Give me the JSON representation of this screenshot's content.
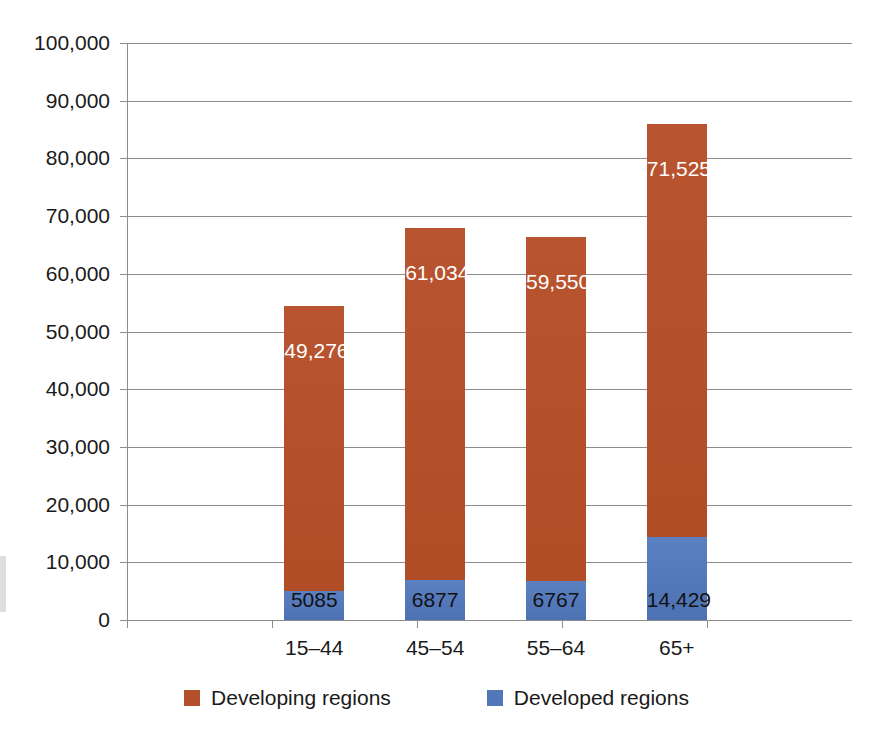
{
  "chart_data": {
    "type": "bar",
    "subtype": "stacked-vertical",
    "title": "",
    "subtitle": "",
    "xlabel": "",
    "ylabel": "",
    "ylim": [
      0,
      100000
    ],
    "ytick_step": 10000,
    "grid": true,
    "legend_position": "bottom",
    "categories": [
      "15–44",
      "45–54",
      "55–64",
      "65+"
    ],
    "ytick_labels": [
      "100,000",
      "90,000",
      "80,000",
      "70,000",
      "60,000",
      "50,000",
      "40,000",
      "30,000",
      "20,000",
      "10,000",
      "0"
    ],
    "ytick_values": [
      100000,
      90000,
      80000,
      70000,
      60000,
      50000,
      40000,
      30000,
      20000,
      10000,
      0
    ],
    "series": [
      {
        "name": "Developing regions",
        "color": "#b5512a",
        "values": [
          49276,
          61034,
          59550,
          71525
        ],
        "data_labels": [
          "49,276",
          "61,034",
          "59,550",
          "71,525"
        ]
      },
      {
        "name": "Developed regions",
        "color": "#5277b9",
        "values": [
          5085,
          6877,
          6767,
          14429
        ],
        "data_labels": [
          "5085",
          "6877",
          "6767",
          "14,429"
        ]
      }
    ],
    "totals": [
      54361,
      67911,
      66317,
      85954
    ]
  },
  "legend": {
    "items": [
      {
        "label": "Developing regions",
        "color": "#b5512a"
      },
      {
        "label": "Developed regions",
        "color": "#5277b9"
      }
    ]
  },
  "colors": {
    "developing": "#b5512a",
    "developed": "#5277b9",
    "grid": "#8c8c8c",
    "text": "#1a1a1a",
    "background": "#ffffff"
  }
}
